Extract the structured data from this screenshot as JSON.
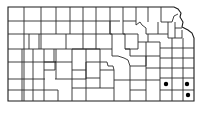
{
  "map": {
    "region": "Kansas",
    "type": "county outline distribution map",
    "colors": {
      "background": "#ffffff",
      "lines": "#2a2a2a",
      "markers": "#000000"
    },
    "markers": [
      {
        "x": 166,
        "y": 84,
        "label": "occurrence"
      },
      {
        "x": 187,
        "y": 84,
        "label": "occurrence"
      },
      {
        "x": 188,
        "y": 95,
        "label": "occurrence"
      }
    ]
  }
}
